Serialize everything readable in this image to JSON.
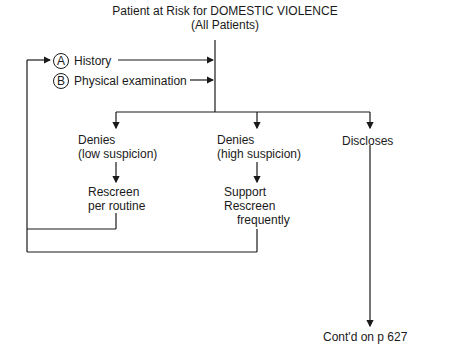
{
  "title": {
    "line1": "Patient at Risk for DOMESTIC VIOLENCE",
    "line2": "(All Patients)"
  },
  "inputs": [
    {
      "marker": "A",
      "label": "History"
    },
    {
      "marker": "B",
      "label": "Physical examination"
    }
  ],
  "branches": [
    {
      "line1": "Denies",
      "line2": "(low suspicion)",
      "action_line1": "Rescreen",
      "action_line2": "per routine"
    },
    {
      "line1": "Denies",
      "line2": "(high suspicion)",
      "action_line1": "Support",
      "action_line2": "Rescreen",
      "action_line3": "frequently"
    },
    {
      "line1": "Discloses"
    }
  ],
  "continuation": "Cont'd on p 627"
}
